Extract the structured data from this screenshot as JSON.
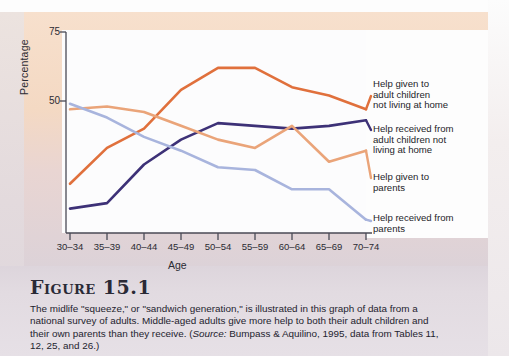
{
  "figure": {
    "number_label": "Figure 15.1",
    "caption_part1": "The midlife \"squeeze,\" or \"sandwich generation,\" is illustrated in this graph of data from a national survey of adults. Middle-aged adults give more help to both their adult children and their own parents than they receive. (",
    "caption_source_label": "Source:",
    "caption_part2": " Bumpass & Aquilino, 1995, data from Tables 11, 12, 25, and 26.)"
  },
  "chart_data": {
    "type": "line",
    "title": "",
    "xlabel": "Age",
    "ylabel": "Percentage",
    "ylim": [
      0,
      75
    ],
    "yticks": [
      50,
      75
    ],
    "grid": false,
    "legend_position": "right",
    "categories": [
      "30–34",
      "35–39",
      "40–44",
      "45–49",
      "50–54",
      "55–59",
      "60–64",
      "65–69",
      "70–74"
    ],
    "series": [
      {
        "name": "Help given to adult children not living at home",
        "color": "#e0703c",
        "values": [
          20,
          33,
          40,
          54,
          62,
          62,
          55,
          52,
          47
        ]
      },
      {
        "name": "Help received from adult children not living at home",
        "color": "#3d3177",
        "values": [
          11,
          13,
          27,
          36,
          42,
          41,
          40,
          41,
          43
        ]
      },
      {
        "name": "Help given to parents",
        "color": "#eaa479",
        "values": [
          47,
          48,
          46,
          41,
          36,
          33,
          41,
          28,
          32
        ]
      },
      {
        "name": "Help received from parents",
        "color": "#a8b4dd",
        "values": [
          49,
          44,
          37,
          32,
          26,
          25,
          18,
          18,
          7
        ]
      }
    ]
  },
  "legend": [
    {
      "label_line1": "Help given to",
      "label_line2": "adult children",
      "label_line3": "not living at home",
      "color": "#e0703c"
    },
    {
      "label_line1": "Help received from",
      "label_line2": "adult children not",
      "label_line3": "living at home",
      "color": "#3d3177"
    },
    {
      "label_line1": "Help given to",
      "label_line2": "parents",
      "label_line3": "",
      "color": "#eaa479"
    },
    {
      "label_line1": "Help received from",
      "label_line2": "parents",
      "label_line3": "",
      "color": "#a8b4dd"
    }
  ]
}
